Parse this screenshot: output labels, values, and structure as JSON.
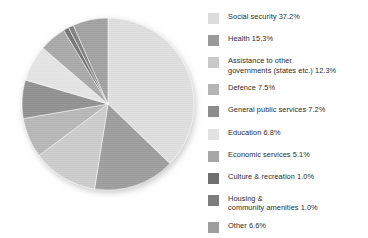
{
  "chart_data": {
    "type": "pie",
    "title": "",
    "subtitle": "",
    "xlabel": "",
    "ylabel": "",
    "legend_position": "right",
    "grid": false,
    "units": "percent",
    "start_angle_deg": 0,
    "direction": "clockwise",
    "categories": [
      "Social security",
      "Health",
      "Assistance to other governments (states etc.)",
      "Defence",
      "General public services",
      "Education",
      "Economic services",
      "Culture & recreation",
      "Housing & community amenities",
      "Other"
    ],
    "values": [
      37.2,
      15.3,
      12.3,
      7.5,
      7.2,
      6.8,
      5.1,
      1.0,
      1.0,
      6.6
    ],
    "colors": [
      "#dcdcdc",
      "#9a9a9a",
      "#c9c9c9",
      "#b4b4b4",
      "#8d8d8d",
      "#e2e2e2",
      "#a6a6a6",
      "#6f6f6f",
      "#7d7d7d",
      "#9e9e9e"
    ]
  },
  "legend": {
    "items": [
      {
        "label": "Social security 37.2%",
        "color": "#dcdcdc",
        "lines": 1
      },
      {
        "label": "Health 15.3%",
        "color": "#9a9a9a",
        "lines": 1
      },
      {
        "label": "Assistance to other\ngovernments (states etc.) 12.3%",
        "color": "#c9c9c9",
        "lines": 2
      },
      {
        "label": "Defence 7.5%",
        "color": "#b4b4b4",
        "lines": 1
      },
      {
        "label": "General public services 7.2%",
        "color": "#8d8d8d",
        "lines": 1
      },
      {
        "label": "Education 6.8%",
        "color": "#e2e2e2",
        "lines": 1
      },
      {
        "label": "Economic services 5.1%",
        "color": "#a6a6a6",
        "lines": 1
      },
      {
        "label": "Culture & recreation 1.0%",
        "color": "#6f6f6f",
        "lines": 1
      },
      {
        "label": "Housing &\ncommunity amenities 1.0%",
        "color": "#7d7d7d",
        "lines": 2
      },
      {
        "label": "Other 6.6%",
        "color": "#9e9e9e",
        "lines": 1
      }
    ]
  }
}
